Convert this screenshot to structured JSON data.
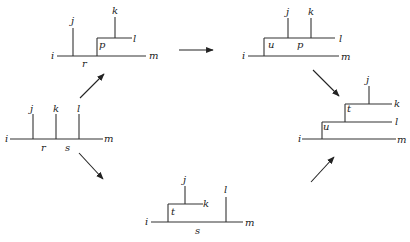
{
  "diagrams": [
    {
      "id": "start",
      "labels": [
        {
          "text": "i",
          "x": 5,
          "y": 142
        },
        {
          "text": "j",
          "x": 30,
          "y": 112
        },
        {
          "text": "k",
          "x": 53,
          "y": 112
        },
        {
          "text": "l",
          "x": 77,
          "y": 112
        },
        {
          "text": "r",
          "x": 41,
          "y": 151
        },
        {
          "text": "s",
          "x": 65,
          "y": 151
        },
        {
          "text": "m",
          "x": 104,
          "y": 142
        }
      ],
      "edges": [
        [
          10,
          139,
          103,
          139
        ],
        [
          33,
          114,
          33,
          139
        ],
        [
          56,
          114,
          56,
          139
        ],
        [
          79,
          114,
          79,
          139
        ]
      ]
    },
    {
      "id": "top-left",
      "labels": [
        {
          "text": "i",
          "x": 51,
          "y": 59
        },
        {
          "text": "j",
          "x": 71,
          "y": 24
        },
        {
          "text": "k",
          "x": 112,
          "y": 14
        },
        {
          "text": "p",
          "x": 99,
          "y": 48
        },
        {
          "text": "l",
          "x": 133,
          "y": 42
        },
        {
          "text": "r",
          "x": 82,
          "y": 67
        },
        {
          "text": "m",
          "x": 149,
          "y": 59
        }
      ],
      "edges": [
        [
          57,
          56,
          146,
          56
        ],
        [
          73,
          28,
          73,
          56
        ],
        [
          97,
          38,
          97,
          56
        ],
        [
          97,
          38,
          132,
          38
        ],
        [
          115,
          17,
          115,
          38
        ]
      ]
    },
    {
      "id": "top-right",
      "labels": [
        {
          "text": "i",
          "x": 242,
          "y": 59
        },
        {
          "text": "j",
          "x": 286,
          "y": 15
        },
        {
          "text": "k",
          "x": 308,
          "y": 15
        },
        {
          "text": "u",
          "x": 268,
          "y": 48
        },
        {
          "text": "p",
          "x": 297,
          "y": 48
        },
        {
          "text": "l",
          "x": 339,
          "y": 42
        },
        {
          "text": "m",
          "x": 341,
          "y": 60
        }
      ],
      "edges": [
        [
          248,
          56,
          339,
          56
        ],
        [
          264,
          38,
          264,
          56
        ],
        [
          264,
          38,
          335,
          38
        ],
        [
          288,
          18,
          288,
          38
        ],
        [
          311,
          18,
          311,
          38
        ]
      ]
    },
    {
      "id": "right",
      "labels": [
        {
          "text": "i",
          "x": 298,
          "y": 142
        },
        {
          "text": "j",
          "x": 366,
          "y": 83
        },
        {
          "text": "k",
          "x": 394,
          "y": 107
        },
        {
          "text": "t",
          "x": 347,
          "y": 112
        },
        {
          "text": "l",
          "x": 395,
          "y": 125
        },
        {
          "text": "u",
          "x": 323,
          "y": 130
        },
        {
          "text": "m",
          "x": 397,
          "y": 143
        }
      ],
      "edges": [
        [
          302,
          139,
          396,
          139
        ],
        [
          322,
          122,
          322,
          139
        ],
        [
          322,
          122,
          392,
          122
        ],
        [
          345,
          104,
          345,
          122
        ],
        [
          345,
          104,
          392,
          104
        ],
        [
          369,
          86,
          369,
          104
        ]
      ]
    },
    {
      "id": "bottom",
      "labels": [
        {
          "text": "i",
          "x": 145,
          "y": 225
        },
        {
          "text": "j",
          "x": 183,
          "y": 183
        },
        {
          "text": "k",
          "x": 203,
          "y": 207
        },
        {
          "text": "t",
          "x": 171,
          "y": 215
        },
        {
          "text": "l",
          "x": 224,
          "y": 193
        },
        {
          "text": "s",
          "x": 195,
          "y": 234
        },
        {
          "text": "m",
          "x": 245,
          "y": 226
        }
      ],
      "edges": [
        [
          151,
          222,
          243,
          222
        ],
        [
          168,
          204,
          168,
          222
        ],
        [
          168,
          204,
          203,
          204
        ],
        [
          185,
          186,
          185,
          204
        ],
        [
          226,
          197,
          226,
          222
        ]
      ]
    }
  ],
  "arrows": [
    {
      "from": "top-left",
      "to": "top-right",
      "x1": 179,
      "y1": 50,
      "x2": 213,
      "y2": 50
    },
    {
      "from": "start",
      "to": "top-left",
      "x1": 80,
      "y1": 98,
      "x2": 104,
      "y2": 74
    },
    {
      "from": "start",
      "to": "bottom",
      "x1": 79,
      "y1": 153,
      "x2": 103,
      "y2": 179
    },
    {
      "from": "top-right",
      "to": "right",
      "x1": 313,
      "y1": 70,
      "x2": 339,
      "y2": 96
    },
    {
      "from": "bottom",
      "to": "right",
      "x1": 311,
      "y1": 182,
      "x2": 334,
      "y2": 157
    }
  ]
}
